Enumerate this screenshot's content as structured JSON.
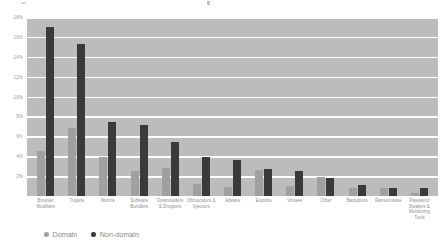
{
  "chart_data": {
    "type": "bar",
    "title": "",
    "xlabel": "",
    "ylabel": "",
    "ylim": [
      0,
      18
    ],
    "grid": true,
    "legend_position": "bottom-left",
    "y_ticks": [
      "18%",
      "16%",
      "14%",
      "12%",
      "10%",
      "8%",
      "6%",
      "4%",
      "2%"
    ],
    "y_tick_values": [
      18,
      16,
      14,
      12,
      10,
      8,
      6,
      4,
      2
    ],
    "categories": [
      "Browser Modifiers",
      "Trojans",
      "Worms",
      "Software Bundlers",
      "Downloaders & Droppers",
      "Obfuscators & Injectors",
      "Adware",
      "Exploits",
      "Viruses",
      "Other",
      "Backdoors",
      "Ransomware",
      "Password Stealers & Monitoring Tools"
    ],
    "series": [
      {
        "name": "Domain",
        "color": "#a0a0a0",
        "values": [
          4.5,
          6.8,
          3.9,
          2.5,
          2.8,
          1.2,
          0.9,
          2.6,
          1.0,
          1.9,
          0.8,
          0.8,
          0.3
        ]
      },
      {
        "name": "Non-domain",
        "color": "#3a3a3a",
        "values": [
          17.0,
          15.3,
          7.4,
          7.1,
          5.4,
          3.9,
          3.6,
          2.7,
          2.5,
          1.8,
          1.1,
          0.8,
          0.8
        ]
      }
    ]
  },
  "legend": {
    "items": [
      {
        "label": "Domain",
        "color": "#a0a0a0"
      },
      {
        "label": "Non-domain",
        "color": "#3a3a3a"
      }
    ]
  },
  "colors": {
    "plot_background": "#bcbcbc",
    "gridline": "#ffffff",
    "domain_bar": "#a0a0a0",
    "nondomain_bar": "#3a3a3a",
    "text": "#8a8a8a"
  }
}
